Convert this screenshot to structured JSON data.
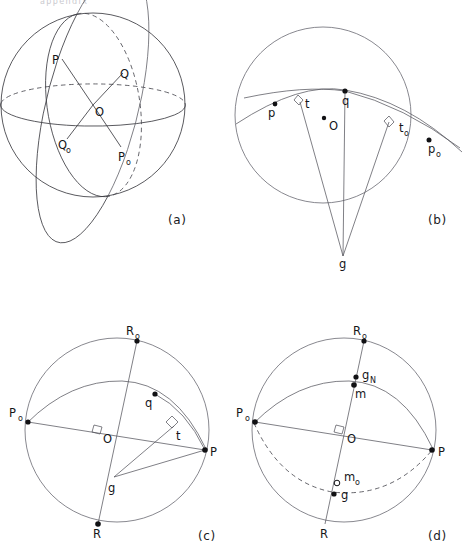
{
  "figure": {
    "page_header_fragment": "appendix",
    "background_color": "#ffffff",
    "ink_color": "#16161a",
    "panels": [
      {
        "id": "a",
        "caption": "(a)",
        "caption_pos": {
          "x": 168,
          "y": 224
        },
        "sphere": {
          "cx": 93,
          "cy": 105,
          "r": 92
        },
        "labels": [
          {
            "text": "P",
            "x": 52,
            "y": 64,
            "sub": ""
          },
          {
            "text": "Q",
            "x": 120,
            "y": 78,
            "sub": ""
          },
          {
            "text": "O",
            "x": 95,
            "y": 116,
            "sub": ""
          },
          {
            "text": "Q",
            "x": 58,
            "y": 149,
            "sub": "o"
          },
          {
            "text": "P",
            "x": 118,
            "y": 161,
            "sub": "o"
          }
        ]
      },
      {
        "id": "b",
        "caption": "(b)",
        "caption_pos": {
          "x": 430,
          "y": 224
        },
        "sphere": {
          "cx": 323,
          "cy": 115,
          "r": 88
        },
        "labels": [
          {
            "text": "p",
            "x": 268,
            "y": 115,
            "sub": ""
          },
          {
            "text": "t",
            "x": 305,
            "y": 108,
            "sub": ""
          },
          {
            "text": "q",
            "x": 344,
            "y": 104,
            "sub": ""
          },
          {
            "text": "O",
            "x": 330,
            "y": 128,
            "sub": ""
          },
          {
            "text": "t",
            "x": 400,
            "y": 130,
            "sub": "o"
          },
          {
            "text": "p",
            "x": 433,
            "y": 152,
            "sub": "o"
          },
          {
            "text": "g",
            "x": 340,
            "y": 266,
            "sub": ""
          }
        ]
      },
      {
        "id": "c",
        "caption": "(c)",
        "caption_pos": {
          "x": 198,
          "y": 540
        },
        "sphere": {
          "cx": 117,
          "cy": 430,
          "r": 92
        },
        "labels": [
          {
            "text": "R",
            "x": 125,
            "y": 336,
            "sub": "o"
          },
          {
            "text": "P",
            "x": 8,
            "y": 413,
            "sub": "o"
          },
          {
            "text": "q",
            "x": 147,
            "y": 405,
            "sub": ""
          },
          {
            "text": "t",
            "x": 178,
            "y": 438,
            "sub": ""
          },
          {
            "text": "O",
            "x": 102,
            "y": 441,
            "sub": ""
          },
          {
            "text": "P",
            "x": 211,
            "y": 456,
            "sub": ""
          },
          {
            "text": "g",
            "x": 110,
            "y": 483,
            "sub": ""
          },
          {
            "text": "R",
            "x": 93,
            "y": 540,
            "sub": ""
          }
        ]
      },
      {
        "id": "d",
        "caption": "(d)",
        "caption_pos": {
          "x": 428,
          "y": 540
        },
        "sphere": {
          "cx": 344,
          "cy": 430,
          "r": 92
        },
        "labels": [
          {
            "text": "R",
            "x": 352,
            "y": 336,
            "sub": "o"
          },
          {
            "text": "g",
            "x": 363,
            "y": 376,
            "sub": "N"
          },
          {
            "text": "m",
            "x": 355,
            "y": 396,
            "sub": ""
          },
          {
            "text": "P",
            "x": 236,
            "y": 413,
            "sub": "o"
          },
          {
            "text": "O",
            "x": 350,
            "y": 441,
            "sub": ""
          },
          {
            "text": "P",
            "x": 440,
            "y": 456,
            "sub": ""
          },
          {
            "text": "m",
            "x": 348,
            "y": 480,
            "sub": "o"
          },
          {
            "text": "g",
            "x": 343,
            "y": 497,
            "sub": ""
          },
          {
            "text": "R",
            "x": 325,
            "y": 540,
            "sub": ""
          }
        ]
      }
    ]
  }
}
